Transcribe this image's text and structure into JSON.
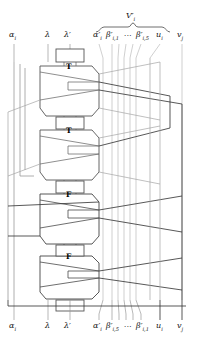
{
  "figure": {
    "type": "gadget-wiring-diagram",
    "brace_label": "V′i",
    "gadget_labels": [
      "T",
      "T",
      "F",
      "F"
    ],
    "top_labels": [
      {
        "name": "alpha-i",
        "text": "αi",
        "x": 14,
        "y": 38
      },
      {
        "name": "lambda",
        "text": "λ",
        "x": 48,
        "y": 38
      },
      {
        "name": "lambda-prime",
        "text": "λ′",
        "x": 68,
        "y": 38
      },
      {
        "name": "alpha-i-prime",
        "text": "α′i",
        "x": 96,
        "y": 38
      },
      {
        "name": "beta-i-1",
        "text": "β′i,1",
        "x": 110,
        "y": 38
      },
      {
        "name": "ellipsis-top",
        "text": "···",
        "x": 128,
        "y": 38
      },
      {
        "name": "beta-i-5",
        "text": "β′i,5",
        "x": 140,
        "y": 38
      },
      {
        "name": "u-i",
        "text": "ui",
        "x": 159,
        "y": 38
      },
      {
        "name": "v-j",
        "text": "vj",
        "x": 180,
        "y": 38
      }
    ],
    "bottom_labels": [
      {
        "name": "alpha-i",
        "text": "αi",
        "x": 14,
        "y": 327
      },
      {
        "name": "lambda",
        "text": "λ",
        "x": 48,
        "y": 327
      },
      {
        "name": "lambda-prime",
        "text": "λ′",
        "x": 68,
        "y": 327
      },
      {
        "name": "alpha-i-prime",
        "text": "α′i",
        "x": 96,
        "y": 327
      },
      {
        "name": "beta-i-5",
        "text": "β′i,5",
        "x": 110,
        "y": 327
      },
      {
        "name": "ellipsis-bottom",
        "text": "···",
        "x": 128,
        "y": 327
      },
      {
        "name": "beta-i-1",
        "text": "β′i,1",
        "x": 140,
        "y": 327
      },
      {
        "name": "u-i",
        "text": "ui",
        "x": 159,
        "y": 327
      },
      {
        "name": "v-j",
        "text": "vj",
        "x": 180,
        "y": 327
      }
    ],
    "colors": {
      "wire_light": "#9a9a9a",
      "wire_dark": "#3a3a3a",
      "gadget_outline": "#555555",
      "text": "#151515",
      "background": "#ffffff"
    },
    "wire_columns": {
      "alpha_i": 14,
      "lambda": 48,
      "lambda_prime": 70,
      "alpha_i_prime": 99,
      "beta_1": 112,
      "beta_2": 119,
      "beta_3": 126,
      "beta_4": 133,
      "beta_5": 141,
      "u_i": 160,
      "v_j": 182
    }
  }
}
